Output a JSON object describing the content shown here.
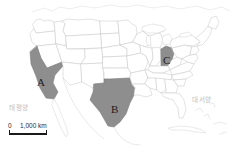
{
  "figure": {
    "name": "us-states-highlight-map",
    "background_color": "#ffffff"
  },
  "map": {
    "region": "United States",
    "state_border_color": "#c9c9c9",
    "state_fill_color": "#ffffff",
    "highlight_fill_color": "#8e8e8e",
    "highlight_border_color": "#7a7a7a",
    "highlighted_states": [
      {
        "letter": "A",
        "state": "California",
        "position": "west-coast"
      },
      {
        "letter": "B",
        "state": "Texas",
        "position": "south-central"
      },
      {
        "letter": "C",
        "state": "Ohio",
        "position": "midwest-east"
      }
    ]
  },
  "labels": {
    "state_a": "A",
    "state_b": "B",
    "state_c": "C",
    "ocean_left": "태평양",
    "ocean_right": "대서양",
    "ocean_label_color": "#bdbdbd"
  },
  "scale_bar": {
    "zero": "0",
    "value": "1,000 km",
    "bar_color": "#1a1a1a"
  }
}
